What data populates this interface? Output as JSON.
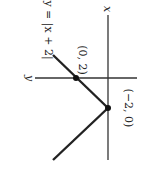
{
  "diagram": {
    "function_label": "y = |x + 2|",
    "x_axis_label": "x",
    "y_axis_label": "y",
    "points": [
      {
        "label": "(0, 2)",
        "x": 0,
        "y": 2
      },
      {
        "label": "(−2, 0)",
        "x": -2,
        "y": 0
      }
    ],
    "orientation": "rotated 90° clockwise",
    "line_color": "#222222"
  }
}
